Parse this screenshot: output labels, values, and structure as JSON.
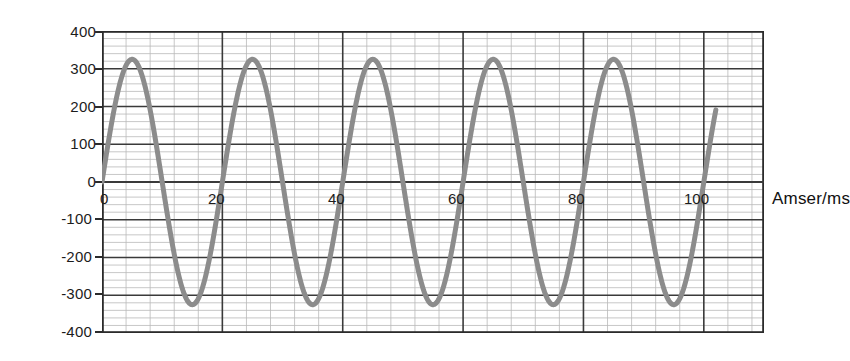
{
  "chart_data": {
    "type": "line",
    "title": "",
    "subtitle": "",
    "xlabel": "Amser/ms",
    "ylabel": "gp enydaidd/V",
    "xlim": [
      0,
      110
    ],
    "ylim": [
      -400,
      400
    ],
    "grid": true,
    "legend": null,
    "x_ticks": [
      "0",
      "20",
      "40",
      "60",
      "80",
      "100"
    ],
    "x_tick_values": [
      0,
      20,
      40,
      60,
      80,
      100
    ],
    "y_ticks": [
      "400",
      "300",
      "200",
      "100",
      "0",
      "-100",
      "-200",
      "-300",
      "-400"
    ],
    "y_tick_values": [
      400,
      300,
      200,
      100,
      0,
      -100,
      -200,
      -300,
      -400
    ],
    "x_major_step": 20,
    "x_minor_step": 4,
    "y_major_step": 100,
    "y_minor_step": 20,
    "series": [
      {
        "name": "gp enydaidd",
        "waveform": "sine",
        "amplitude": 325,
        "period_ms": 20,
        "frequency_hz": 50,
        "phase_deg": 0,
        "t_start_ms": 0,
        "t_end_ms": 102,
        "color": "#8c8c8c",
        "line_width": 5,
        "peaks_ms": [
          5,
          25,
          45,
          65,
          85
        ],
        "peak_value": 325,
        "troughs_ms": [
          15,
          35,
          55,
          75,
          95
        ],
        "trough_value": -325,
        "zero_crossings_ms": [
          0,
          10,
          20,
          30,
          40,
          50,
          60,
          70,
          80,
          90,
          100
        ],
        "end_value": 118
      }
    ],
    "colors": {
      "curve": "#8c8c8c",
      "major_grid": "#3a3a3a",
      "minor_grid": "#b9b9b9",
      "axis": "#2b2b2b",
      "text": "#1c1c1c",
      "background": "#ffffff"
    }
  },
  "axis": {
    "y_title": "gp enydaidd/V",
    "x_title": "Amser/ms",
    "y_labels": [
      "400",
      "300",
      "200",
      "100",
      "0",
      "-100",
      "-200",
      "-300",
      "-400"
    ],
    "x_labels": [
      "0",
      "20",
      "40",
      "60",
      "80",
      "100"
    ]
  }
}
